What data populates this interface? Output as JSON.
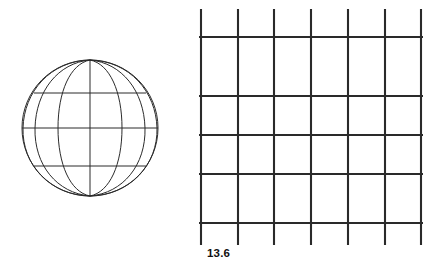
{
  "figure": {
    "label": "13.6",
    "caption_text": "13.6",
    "background_color": "#ffffff",
    "line_color": "#1a1a1a",
    "objects": [
      {
        "name": "wireframe-globe",
        "type": "sphere-wireframe",
        "center_x": 90,
        "center_y": 128,
        "radius": 68,
        "pole_top_y": 60,
        "pole_bottom_y": 196,
        "meridian_count": 7,
        "latitude_count": 3,
        "latitude_y": [
          93,
          128,
          166
        ]
      },
      {
        "name": "wire-mesh-grid",
        "type": "grid",
        "vertical_line_count": 7,
        "horizontal_line_count": 5,
        "vertical_x": [
          201,
          238,
          274,
          311,
          348,
          385,
          421
        ],
        "horizontal_y": [
          37,
          96,
          135,
          174,
          223
        ],
        "vertical_top_y": 9,
        "vertical_bottom_y": 245,
        "horizontal_left_x": 199,
        "horizontal_right_x": 423
      }
    ]
  }
}
